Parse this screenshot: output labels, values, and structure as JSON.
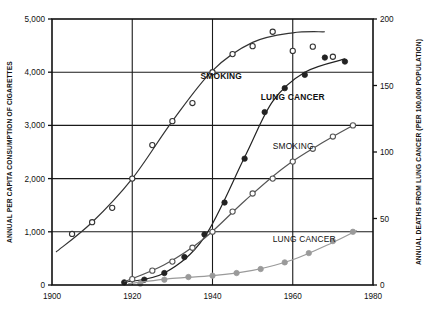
{
  "chart_data": {
    "type": "scatter",
    "title": "",
    "xlabel": "",
    "xlim": [
      1900,
      1980
    ],
    "xticks": [
      1900,
      1920,
      1940,
      1960,
      1980
    ],
    "xtick_labels": [
      "1900",
      "1920",
      "1940",
      "1960",
      "1980"
    ],
    "left_axis": {
      "label": "ANNUAL PER CAPITA CONSUMPTION OF CIGARETTES",
      "ylim": [
        0,
        5000
      ],
      "ticks": [
        0,
        1000,
        2000,
        3000,
        4000,
        5000
      ],
      "tick_labels": [
        "0",
        "1,000",
        "2,000",
        "3,000",
        "4,000",
        "5,000"
      ]
    },
    "right_axis": {
      "label": "ANNUAL DEATHS FROM LUNG CANCER (PER 100,000 POPULATION)",
      "ylim": [
        0,
        200
      ],
      "ticks": [
        0,
        50,
        100,
        150,
        200
      ],
      "tick_labels": [
        "0",
        "50",
        "100",
        "150",
        "200"
      ]
    },
    "grid": true,
    "legend": "inline-labels",
    "series": [
      {
        "name": "SMOKING",
        "label_text": "SMOKING",
        "label_style": "bold",
        "label_x": 1937,
        "label_y": 3870,
        "axis": "left",
        "marker": "open-circle",
        "color": "#333333",
        "points": [
          {
            "x": 1905,
            "y": 960
          },
          {
            "x": 1910,
            "y": 1180
          },
          {
            "x": 1915,
            "y": 1450
          },
          {
            "x": 1920,
            "y": 2000
          },
          {
            "x": 1925,
            "y": 2630
          },
          {
            "x": 1930,
            "y": 3080
          },
          {
            "x": 1935,
            "y": 3420
          },
          {
            "x": 1940,
            "y": 4000
          },
          {
            "x": 1945,
            "y": 4340
          },
          {
            "x": 1950,
            "y": 4490
          },
          {
            "x": 1955,
            "y": 4760
          },
          {
            "x": 1960,
            "y": 4400
          },
          {
            "x": 1965,
            "y": 4480
          },
          {
            "x": 1970,
            "y": 4290
          }
        ],
        "curve": [
          {
            "x": 1901,
            "y": 620
          },
          {
            "x": 1910,
            "y": 1180
          },
          {
            "x": 1920,
            "y": 2000
          },
          {
            "x": 1930,
            "y": 3080
          },
          {
            "x": 1940,
            "y": 4030
          },
          {
            "x": 1950,
            "y": 4560
          },
          {
            "x": 1960,
            "y": 4740
          },
          {
            "x": 1968,
            "y": 4760
          }
        ]
      },
      {
        "name": "LUNG CANCER",
        "label_text": "LUNG CANCER",
        "label_style": "bold",
        "label_x": 1952,
        "label_y": 3480,
        "axis": "right",
        "marker": "filled-circle",
        "color": "#222222",
        "points": [
          {
            "x": 1918,
            "y": 2
          },
          {
            "x": 1923,
            "y": 4
          },
          {
            "x": 1928,
            "y": 9
          },
          {
            "x": 1933,
            "y": 21
          },
          {
            "x": 1938,
            "y": 38
          },
          {
            "x": 1943,
            "y": 62
          },
          {
            "x": 1948,
            "y": 95
          },
          {
            "x": 1953,
            "y": 130
          },
          {
            "x": 1958,
            "y": 148
          },
          {
            "x": 1963,
            "y": 158
          },
          {
            "x": 1968,
            "y": 171
          },
          {
            "x": 1973,
            "y": 168
          }
        ],
        "curve": [
          {
            "x": 1918,
            "y": 2
          },
          {
            "x": 1928,
            "y": 9
          },
          {
            "x": 1938,
            "y": 36
          },
          {
            "x": 1948,
            "y": 96
          },
          {
            "x": 1955,
            "y": 138
          },
          {
            "x": 1963,
            "y": 160
          },
          {
            "x": 1973,
            "y": 170
          }
        ]
      },
      {
        "name": "SMOKING-lower",
        "label_text": "SMOKING",
        "label_style": "plain",
        "label_x": 1955,
        "label_y": 2560,
        "axis": "left",
        "marker": "open-circle",
        "color": "#555555",
        "points": [
          {
            "x": 1920,
            "y": 110
          },
          {
            "x": 1925,
            "y": 270
          },
          {
            "x": 1930,
            "y": 440
          },
          {
            "x": 1935,
            "y": 700
          },
          {
            "x": 1940,
            "y": 1000
          },
          {
            "x": 1945,
            "y": 1380
          },
          {
            "x": 1950,
            "y": 1720
          },
          {
            "x": 1955,
            "y": 2000
          },
          {
            "x": 1960,
            "y": 2320
          },
          {
            "x": 1965,
            "y": 2560
          },
          {
            "x": 1970,
            "y": 2790
          },
          {
            "x": 1975,
            "y": 3000
          }
        ],
        "curve": [
          {
            "x": 1918,
            "y": 60
          },
          {
            "x": 1928,
            "y": 380
          },
          {
            "x": 1938,
            "y": 880
          },
          {
            "x": 1948,
            "y": 1580
          },
          {
            "x": 1958,
            "y": 2220
          },
          {
            "x": 1968,
            "y": 2700
          },
          {
            "x": 1975,
            "y": 3000
          }
        ]
      },
      {
        "name": "LUNG CANCER-lower",
        "label_text": "LUNG CANCER",
        "label_style": "plain",
        "label_x": 1955,
        "label_y": 800,
        "axis": "right",
        "marker": "filled-circle",
        "color": "#9a9a9a",
        "points": [
          {
            "x": 1922,
            "y": 1
          },
          {
            "x": 1928,
            "y": 4
          },
          {
            "x": 1934,
            "y": 6
          },
          {
            "x": 1940,
            "y": 7
          },
          {
            "x": 1946,
            "y": 9
          },
          {
            "x": 1952,
            "y": 12
          },
          {
            "x": 1958,
            "y": 17
          },
          {
            "x": 1964,
            "y": 24
          },
          {
            "x": 1970,
            "y": 33
          },
          {
            "x": 1975,
            "y": 40
          }
        ],
        "curve": [
          {
            "x": 1919,
            "y": 1
          },
          {
            "x": 1930,
            "y": 5
          },
          {
            "x": 1940,
            "y": 7
          },
          {
            "x": 1950,
            "y": 11
          },
          {
            "x": 1960,
            "y": 19
          },
          {
            "x": 1970,
            "y": 32
          },
          {
            "x": 1976,
            "y": 41
          }
        ]
      }
    ]
  }
}
